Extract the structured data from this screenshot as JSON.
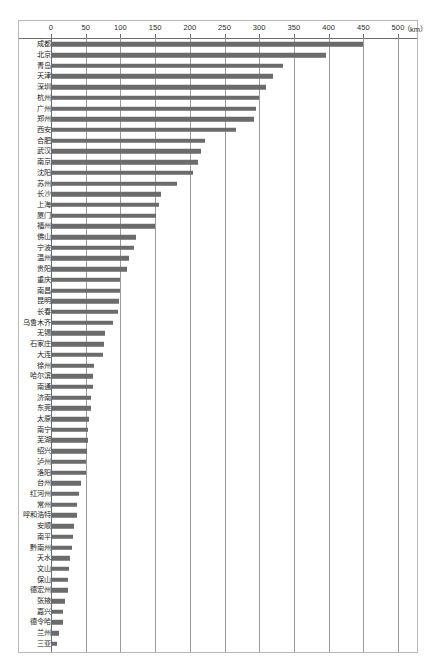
{
  "chart_data": {
    "type": "bar",
    "orientation": "horizontal",
    "title": "",
    "xlabel": "km",
    "ylabel": "",
    "xlim": [
      0,
      500
    ],
    "xticks": [
      0,
      50,
      100,
      150,
      200,
      250,
      300,
      350,
      400,
      450,
      500
    ],
    "unit_note": "（km）",
    "grid": true,
    "legend": "none",
    "bar_color": "#6b6b6b",
    "categories": [
      "成都",
      "北京",
      "青岛",
      "天津",
      "深圳",
      "杭州",
      "广州",
      "郑州",
      "西安",
      "合肥",
      "武汉",
      "南京",
      "沈阳",
      "苏州",
      "长沙",
      "上海",
      "厦门",
      "福州",
      "佛山",
      "宁波",
      "温州",
      "贵阳",
      "重庆",
      "南昌",
      "昆明",
      "长春",
      "乌鲁木齐",
      "无锡",
      "石家庄",
      "大连",
      "徐州",
      "哈尔滨",
      "南通",
      "济南",
      "东莞",
      "太原",
      "南宁",
      "芜湖",
      "绍兴",
      "泸州",
      "洛阳",
      "台州",
      "红河州",
      "常州",
      "呼和浩特",
      "安顺",
      "南平",
      "黔南州",
      "天水",
      "文山",
      "保山",
      "德宏州",
      "张掖",
      "嘉兴",
      "德令哈",
      "兰州",
      "三亚"
    ],
    "values": [
      450,
      396,
      335,
      320,
      310,
      300,
      296,
      293,
      267,
      222,
      216,
      212,
      205,
      182,
      158,
      155,
      152,
      150,
      122,
      120,
      112,
      110,
      100,
      99,
      98,
      96,
      90,
      78,
      77,
      75,
      62,
      61,
      60,
      58,
      57,
      55,
      54,
      53,
      52,
      51,
      50,
      43,
      40,
      38,
      37,
      33,
      32,
      30,
      28,
      26,
      25,
      24,
      20,
      18,
      18,
      11,
      9
    ]
  }
}
